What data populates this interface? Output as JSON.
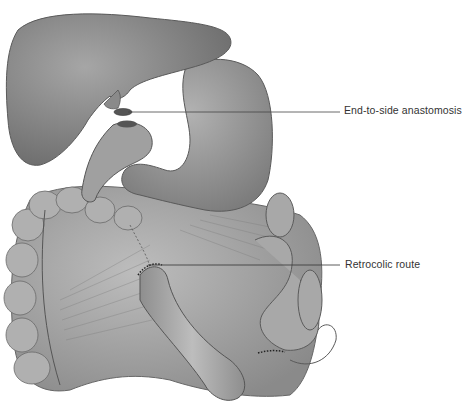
{
  "figure": {
    "colors": {
      "background": "#ffffff",
      "organ_fill": "#8c8c8c",
      "organ_light": "#b4b4b4",
      "outline": "#555555",
      "leader_line": "#444444"
    },
    "labels": [
      {
        "id": "anastomosis",
        "text": "End-to-side anastomosis"
      },
      {
        "id": "retrocolic",
        "text": "Retrocolic route"
      }
    ]
  }
}
